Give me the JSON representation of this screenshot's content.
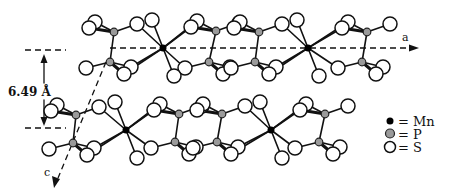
{
  "figure": {
    "width": 452,
    "height": 196
  },
  "axes": {
    "a_label": "a",
    "c_label": "c"
  },
  "interlayer_distance": {
    "label": "6.49 Å",
    "value": 6.49,
    "unit": "Å"
  },
  "legend": {
    "items": [
      {
        "symbol": "filled-black-dot",
        "label": "= Mn"
      },
      {
        "symbol": "gray-circle",
        "label": "= P"
      },
      {
        "symbol": "open-circle",
        "label": "= S"
      }
    ]
  },
  "colors": {
    "mn": "#000000",
    "p": "#9a9a9a",
    "s": "#ffffff",
    "line": "#111111"
  },
  "layers": [
    {
      "name": "upper-layer",
      "mn": [
        [
          163,
          48
        ],
        [
          308,
          48
        ]
      ],
      "p": [
        [
          114,
          32
        ],
        [
          110,
          62
        ],
        [
          216,
          31
        ],
        [
          209,
          62
        ],
        [
          259,
          32
        ],
        [
          255,
          62
        ],
        [
          367,
          32
        ],
        [
          362,
          62
        ]
      ]
    },
    {
      "name": "lower-layer",
      "mn": [
        [
          126,
          130
        ],
        [
          271,
          130
        ]
      ],
      "p": [
        [
          76,
          115
        ],
        [
          73,
          143
        ],
        [
          179,
          114
        ],
        [
          175,
          142
        ],
        [
          222,
          114
        ],
        [
          217,
          142
        ],
        [
          325,
          114
        ],
        [
          319,
          142
        ]
      ]
    }
  ]
}
